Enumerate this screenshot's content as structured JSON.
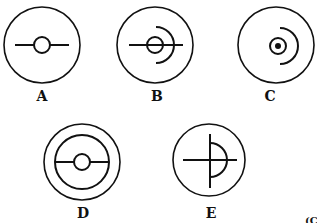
{
  "figures": [
    {
      "id": "A",
      "label": "A",
      "description": "circle with horizontal line through small centered circle"
    },
    {
      "id": "B",
      "label": "B",
      "description": "circle with horizontal line, small circle and arc on right"
    },
    {
      "id": "C",
      "label": "C",
      "description": "circle with small circle, center dot and arc on right"
    },
    {
      "id": "D",
      "label": "D",
      "description": "double concentric circles with horizontal line and small centered circle"
    },
    {
      "id": "E",
      "label": "E",
      "description": "circle with cross lines and half-circle arc on right"
    }
  ],
  "corner_mark": "(C",
  "colors": {
    "ink": "#111111",
    "background": "#ffffff"
  }
}
